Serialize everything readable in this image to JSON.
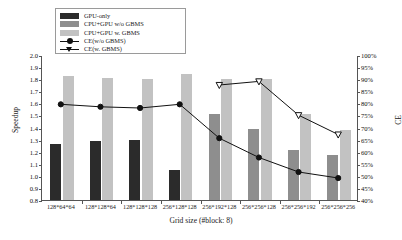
{
  "chart_data": {
    "type": "bar",
    "title": "",
    "xlabel": "Grid size (#block: 8)",
    "ylabel": "Speedup",
    "ylabel_right": "CE",
    "ylim": [
      0.8,
      2.0
    ],
    "ylim_right": [
      40,
      100
    ],
    "yticks": [
      "2.0",
      "1.9",
      "1.8",
      "1.7",
      "1.6",
      "1.5",
      "1.4",
      "1.3",
      "1.2",
      "1.1",
      "1.0",
      "0.9",
      "0.8"
    ],
    "yticks_right": [
      "100%",
      "95%",
      "90%",
      "85%",
      "80%",
      "75%",
      "70%",
      "65%",
      "60%",
      "55%",
      "50%",
      "45%",
      "40%"
    ],
    "grid": false,
    "legend_position": "top-left",
    "categories": [
      "128*64*64",
      "128*128*64",
      "128*128*128",
      "256*128*128",
      "256*192*128",
      "256*256*128",
      "256*256*192",
      "256*256*256"
    ],
    "series": [
      {
        "name": "GPU-only",
        "type": "bar",
        "axis": "left",
        "color": "#2b2b2b",
        "values": [
          1.26,
          1.29,
          1.3,
          1.05,
          null,
          null,
          null,
          null
        ]
      },
      {
        "name": "CPU+GPU w/o GBMS",
        "type": "bar",
        "axis": "left",
        "color": "#8e8e8e",
        "values": [
          null,
          null,
          null,
          null,
          1.51,
          1.39,
          1.21,
          1.17
        ]
      },
      {
        "name": "CPU+GPU w. GBMS",
        "type": "bar",
        "axis": "left",
        "color": "#c2c2c2",
        "values": [
          1.83,
          1.81,
          1.8,
          1.84,
          1.8,
          1.8,
          1.51,
          1.38
        ]
      },
      {
        "name": "CE(w/o GBMS)",
        "type": "line",
        "axis": "right",
        "marker": "filled-circle",
        "color": "#111111",
        "values": [
          80,
          79,
          78.5,
          80,
          66,
          58,
          52,
          49.5
        ]
      },
      {
        "name": "CE(w. GBMS)",
        "type": "line",
        "axis": "right",
        "marker": "open-triangle",
        "color": "#111111",
        "values": [
          null,
          null,
          null,
          null,
          88,
          89.5,
          75.5,
          67.5
        ]
      }
    ]
  },
  "legend": {
    "entries": [
      {
        "label": "GPU-only",
        "swatch": "s0"
      },
      {
        "label": "CPU+GPU w/o GBMS",
        "swatch": "s1"
      },
      {
        "label": "CPU+GPU w. GBMS",
        "swatch": "s2"
      },
      {
        "label": "CE(w/o GBMS)",
        "swatch": "line-dot"
      },
      {
        "label": "CE(w. GBMS)",
        "swatch": "line-tri"
      }
    ]
  }
}
